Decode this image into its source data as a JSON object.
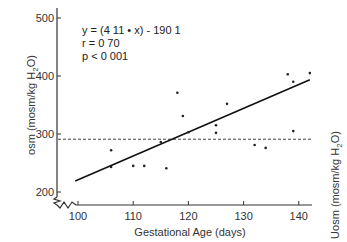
{
  "chart_data": {
    "type": "scatter",
    "title": "",
    "xlabel": "Gestational Age (days)",
    "ylabel_left": "osm (mosm/kg H2O)",
    "ylabel_right": "Uosm (mosm/kg H2O)",
    "xlim": [
      97,
      143
    ],
    "ylim": [
      185,
      510
    ],
    "xticks": [
      100,
      110,
      120,
      130,
      140
    ],
    "yticks": [
      200,
      300,
      400,
      500
    ],
    "axis_breaks": [
      "x",
      "y"
    ],
    "grid": false,
    "annotations": [
      "y = (4 11 • x) - 190 1",
      "r = 0 70",
      "p < 0 001"
    ],
    "regression": {
      "slope": 4.11,
      "intercept": -190.1,
      "x_range": [
        99.5,
        142
      ]
    },
    "reference_line": {
      "y": 291,
      "style": "dashed"
    },
    "points": [
      {
        "x": 106,
        "y": 243
      },
      {
        "x": 106,
        "y": 272
      },
      {
        "x": 110,
        "y": 245
      },
      {
        "x": 112,
        "y": 245
      },
      {
        "x": 115,
        "y": 286
      },
      {
        "x": 116,
        "y": 241
      },
      {
        "x": 118,
        "y": 371
      },
      {
        "x": 119,
        "y": 331
      },
      {
        "x": 120,
        "y": 303
      },
      {
        "x": 125,
        "y": 315
      },
      {
        "x": 125,
        "y": 302
      },
      {
        "x": 127,
        "y": 352
      },
      {
        "x": 132,
        "y": 281
      },
      {
        "x": 134,
        "y": 276
      },
      {
        "x": 138,
        "y": 403
      },
      {
        "x": 139,
        "y": 390
      },
      {
        "x": 139,
        "y": 305
      },
      {
        "x": 142,
        "y": 405
      }
    ]
  }
}
